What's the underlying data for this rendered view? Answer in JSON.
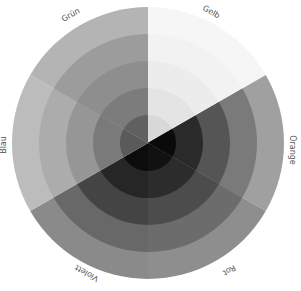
{
  "center": {
    "x": 148,
    "y": 143
  },
  "radius": 136,
  "ring_radii": [
    28,
    55,
    82,
    109,
    136
  ],
  "sectors": [
    {
      "name": "Gelb",
      "start": -90,
      "end": -30,
      "shades": [
        "#d8d8d8",
        "#e4e4e4",
        "#ececec",
        "#f2f2f2",
        "#f6f6f6"
      ]
    },
    {
      "name": "Orange",
      "start": -30,
      "end": 30,
      "shades": [
        "#0a0a0a",
        "#2a2a2a",
        "#555555",
        "#7a7a7a",
        "#a0a0a0"
      ]
    },
    {
      "name": "Rot",
      "start": 30,
      "end": 90,
      "shades": [
        "#111111",
        "#2c2c2c",
        "#4c4c4c",
        "#6c6c6c",
        "#8e8e8e"
      ]
    },
    {
      "name": "Violett",
      "start": 90,
      "end": 150,
      "shades": [
        "#0c0c0c",
        "#262626",
        "#444444",
        "#686868",
        "#8a8a8a"
      ]
    },
    {
      "name": "Blau",
      "start": 150,
      "end": 210,
      "shades": [
        "#5a5a5a",
        "#7a7a7a",
        "#969696",
        "#acacac",
        "#bcbcbc"
      ]
    },
    {
      "name": "Grün",
      "start": 210,
      "end": 270,
      "shades": [
        "#606060",
        "#7c7c7c",
        "#8e8e8e",
        "#9c9c9c",
        "#b4b4b4"
      ]
    }
  ],
  "labels": [
    {
      "text": "Gelb",
      "x": 210,
      "y": 14,
      "rotate": 30
    },
    {
      "text": "Orange",
      "x": 290,
      "y": 150,
      "rotate": 90
    },
    {
      "text": "Rot",
      "x": 228,
      "y": 268,
      "rotate": 150
    },
    {
      "text": "Violett",
      "x": 88,
      "y": 271,
      "rotate": 210
    },
    {
      "text": "Blau",
      "x": 6,
      "y": 145,
      "rotate": 270
    },
    {
      "text": "Grün",
      "x": 72,
      "y": 17,
      "rotate": -30
    }
  ]
}
